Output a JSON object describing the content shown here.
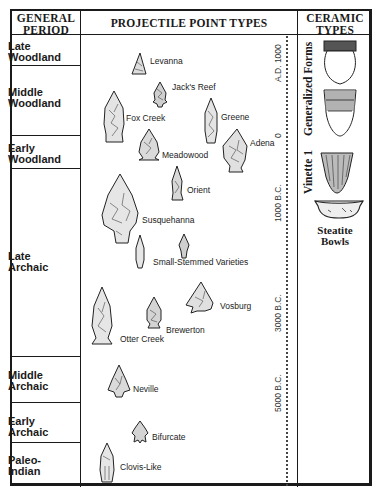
{
  "headers": {
    "period": [
      "GENERAL",
      "PERIOD"
    ],
    "points": "PROJECTILE POINT TYPES",
    "ceramic": [
      "CERAMIC",
      "TYPES"
    ]
  },
  "periods": [
    {
      "line1": "Late",
      "line2": "Woodland"
    },
    {
      "line1": "Middle",
      "line2": "Woodland"
    },
    {
      "line1": "Early",
      "line2": "Woodland"
    },
    {
      "line1": "Late",
      "line2": "Archaic"
    },
    {
      "line1": "Middle",
      "line2": "Archaic"
    },
    {
      "line1": "Early",
      "line2": "Archaic"
    },
    {
      "line1": "Paleo-",
      "line2": "Indian"
    }
  ],
  "point_types": [
    {
      "name": "Levanna"
    },
    {
      "name": "Jack's Reef"
    },
    {
      "name": "Fox Creek"
    },
    {
      "name": "Greene"
    },
    {
      "name": "Meadowood"
    },
    {
      "name": "Adena"
    },
    {
      "name": "Orient"
    },
    {
      "name": "Susquehanna"
    },
    {
      "name": "Small-Stemmed Varieties"
    },
    {
      "name": "Vosburg"
    },
    {
      "name": "Brewerton"
    },
    {
      "name": "Otter Creek"
    },
    {
      "name": "Neville"
    },
    {
      "name": "Bifurcate"
    },
    {
      "name": "Clovis-Like"
    }
  ],
  "timeline": [
    "A.D. 1000",
    "0",
    "1000 B.C.",
    "3000 B.C.",
    "5000 B.C."
  ],
  "ceramics": {
    "generalized_label": "Generalized Forms",
    "vinette_label": "Vinette 1",
    "steatite": [
      "Steatite",
      "Bowls"
    ]
  }
}
